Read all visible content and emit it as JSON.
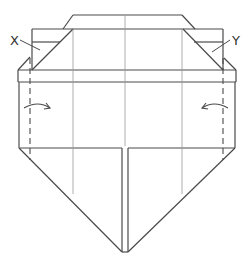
{
  "diagram": {
    "type": "origami-fold-step",
    "labels": {
      "left_flap": "X",
      "right_flap": "Y"
    },
    "annotations": {
      "left_arrow": "fold-right-arrow",
      "right_arrow": "fold-left-arrow",
      "left_fold_line": "valley-fold-dashed-line",
      "right_fold_line": "valley-fold-dashed-line"
    },
    "colors": {
      "line": "#4a4a4a",
      "crease": "#9a9a9a",
      "background": "#ffffff"
    }
  }
}
